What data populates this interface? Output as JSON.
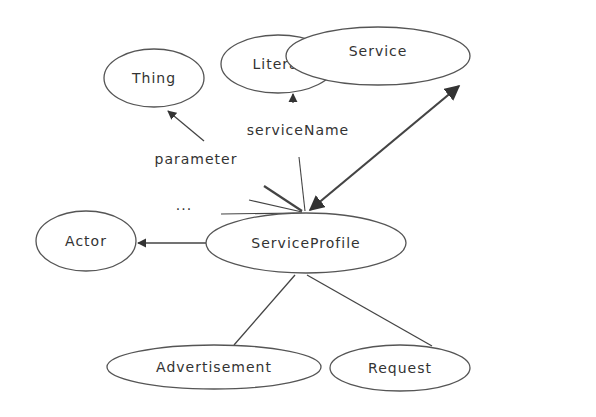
{
  "diagram": {
    "type": "ontology-graph",
    "nodes": [
      {
        "id": "thing",
        "label": "Thing",
        "cx": 154,
        "cy": 78,
        "rx": 50,
        "ry": 29
      },
      {
        "id": "literal",
        "label": "Literal",
        "cx": 278,
        "cy": 64,
        "rx": 57,
        "ry": 29
      },
      {
        "id": "service",
        "label": "Service",
        "cx": 378,
        "cy": 56,
        "rx": 92,
        "ry": 29
      },
      {
        "id": "actor",
        "label": "Actor",
        "cx": 86,
        "cy": 241,
        "rx": 50,
        "ry": 30
      },
      {
        "id": "serviceprofile",
        "label": "ServiceProfile",
        "cx": 306,
        "cy": 241,
        "rx": 100,
        "ry": 30
      },
      {
        "id": "advertisement",
        "label": "Advertisement",
        "cx": 214,
        "cy": 367,
        "rx": 107,
        "ry": 22
      },
      {
        "id": "request",
        "label": "Request",
        "cx": 400,
        "cy": 368,
        "rx": 70,
        "ry": 23
      }
    ],
    "edges": [
      {
        "from": "serviceprofile",
        "to": "thing",
        "label": "parameter",
        "arrow": true
      },
      {
        "from": "serviceprofile",
        "to": "literal",
        "label": "serviceName",
        "arrow": true
      },
      {
        "from": "serviceprofile",
        "to": "service",
        "label": "",
        "arrow": true,
        "bidirectional": true
      },
      {
        "from": "serviceprofile",
        "to": "actor",
        "label": "",
        "arrow": true
      },
      {
        "from": "serviceprofile",
        "to": "advertisement",
        "label": "",
        "arrow": false
      },
      {
        "from": "serviceprofile",
        "to": "request",
        "label": "",
        "arrow": false
      }
    ],
    "labels": {
      "parameter": "parameter",
      "serviceName": "serviceName",
      "ellipsis": "..."
    }
  }
}
